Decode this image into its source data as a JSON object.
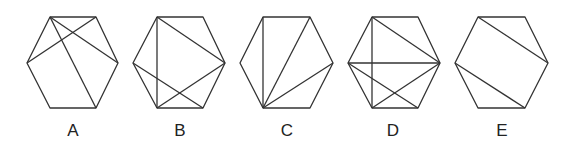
{
  "figures": [
    {
      "label": "A",
      "vertices": {
        "TL": [
          50,
          17
        ],
        "TR": [
          96,
          17
        ],
        "R": [
          118,
          63
        ],
        "BR": [
          96,
          108
        ],
        "BL": [
          50,
          108
        ],
        "L": [
          27,
          63
        ]
      },
      "diagonals": [
        [
          "TL",
          "R"
        ],
        [
          "TL",
          "BR"
        ],
        [
          "L",
          "TR"
        ]
      ],
      "label_pos": [
        73,
        136
      ]
    },
    {
      "label": "B",
      "vertices": {
        "TL": [
          157,
          17
        ],
        "TR": [
          203,
          17
        ],
        "R": [
          225,
          63
        ],
        "BR": [
          203,
          108
        ],
        "BL": [
          157,
          108
        ],
        "L": [
          133,
          63
        ]
      },
      "diagonals": [
        [
          "TL",
          "R"
        ],
        [
          "TL",
          "BL"
        ],
        [
          "L",
          "BR"
        ],
        [
          "R",
          "BL"
        ]
      ],
      "label_pos": [
        180,
        136
      ]
    },
    {
      "label": "C",
      "vertices": {
        "TL": [
          263,
          17
        ],
        "TR": [
          310,
          17
        ],
        "R": [
          333,
          63
        ],
        "BR": [
          310,
          108
        ],
        "BL": [
          263,
          108
        ],
        "L": [
          240,
          63
        ]
      },
      "diagonals": [
        [
          "BL",
          "TL"
        ],
        [
          "BL",
          "TR"
        ],
        [
          "BL",
          "R"
        ]
      ],
      "label_pos": [
        287,
        136
      ]
    },
    {
      "label": "D",
      "vertices": {
        "TL": [
          372,
          17
        ],
        "TR": [
          418,
          17
        ],
        "R": [
          440,
          63
        ],
        "BR": [
          418,
          108
        ],
        "BL": [
          372,
          108
        ],
        "L": [
          348,
          63
        ]
      },
      "diagonals": [
        [
          "TL",
          "R"
        ],
        [
          "TL",
          "BL"
        ],
        [
          "L",
          "R"
        ],
        [
          "L",
          "BR"
        ],
        [
          "R",
          "BL"
        ]
      ],
      "label_pos": [
        393,
        136
      ]
    },
    {
      "label": "E",
      "vertices": {
        "TL": [
          478,
          17
        ],
        "TR": [
          525,
          17
        ],
        "R": [
          548,
          63
        ],
        "BR": [
          525,
          108
        ],
        "BL": [
          478,
          108
        ],
        "L": [
          455,
          63
        ]
      },
      "diagonals": [
        [
          "TL",
          "R"
        ],
        [
          "L",
          "BR"
        ]
      ],
      "label_pos": [
        502,
        136
      ]
    }
  ],
  "colors": {
    "stroke": "#333333",
    "label": "#222222",
    "background": "#ffffff"
  }
}
